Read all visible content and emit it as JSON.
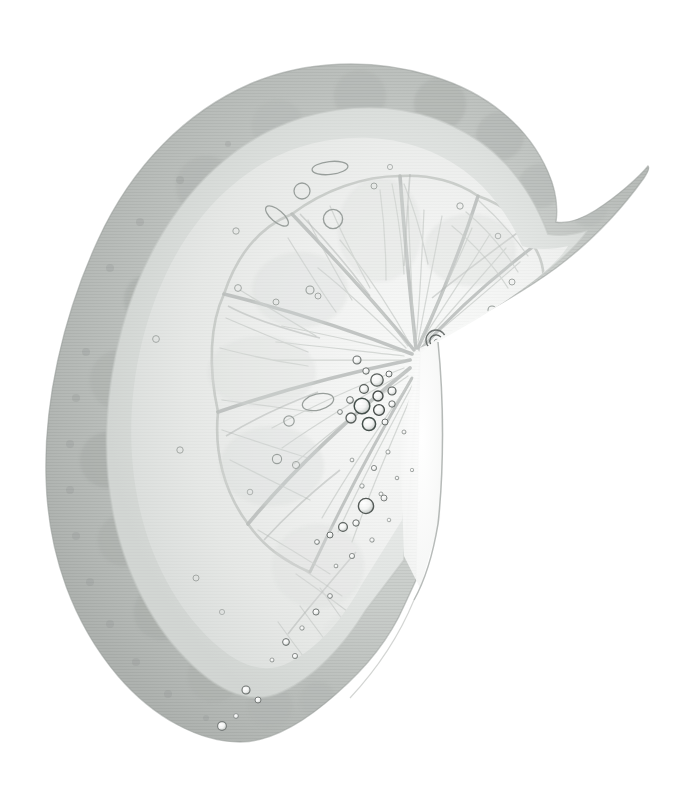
{
  "image": {
    "subject": "citrus-fruit-half-slice",
    "common_name": "Lemon slice",
    "orientation": "cut face toward viewer, rind arcing from lower-left around the top to the upper-right",
    "rendering": "desaturated grayscale photographic scan on plain white background",
    "background_color": "#ffffff",
    "canvas": {
      "width": 692,
      "height": 804
    }
  },
  "palette": {
    "background": "#ffffff",
    "rind_outer": "#b6bab7",
    "rind_mid": "#c0c4c1",
    "rind_inner": "#cbcfcc",
    "pith_band": "#dcdfdd",
    "flesh_light": "#f2f3f2",
    "flesh_mid": "#e6e8e6",
    "flesh_shadow": "#d4d7d5",
    "segment_membrane": "#b9bdbb",
    "vesicle_line": "#c7cbc8",
    "core_white": "#fbfbfb",
    "bubble_outline": "#6e7371",
    "bubble_dark": "#4a4f4d",
    "bubble_fill": "#f6f7f6",
    "cut_edge_line": "#9fa4a1"
  },
  "geometry": {
    "peel_outer_left_x": 40,
    "peel_top_y": 62,
    "peel_right_tip_x": 648,
    "bottom_tip_y": 742,
    "core_center_x": 420,
    "core_center_y": 352,
    "cut_edge_top_y": 346,
    "cut_edge_bottom_y": 600
  },
  "parts": [
    {
      "id": "rind",
      "label": "Rind / exocarp",
      "note": "mid-gray mottled band forming the outer arc"
    },
    {
      "id": "pith",
      "label": "Pith / albedo",
      "note": "paler inner band between rind and flesh"
    },
    {
      "id": "flesh",
      "label": "Flesh / endocarp",
      "note": "pale segmented pulp with radiating juice vesicles"
    },
    {
      "id": "membranes",
      "label": "Segment membranes",
      "note": "darker curved dividing walls between segments"
    },
    {
      "id": "core",
      "label": "Central core / columella",
      "note": "bright wedge at the cut center where segments converge"
    },
    {
      "id": "bubbles",
      "label": "Air bubbles",
      "note": "ring-outlined droplets clustered along the cut face near the core"
    }
  ],
  "segments": [
    {
      "index": 1,
      "label": "segment-upper-right",
      "angle_deg": -62
    },
    {
      "index": 2,
      "label": "segment-upper-right-inner",
      "angle_deg": -34
    },
    {
      "index": 3,
      "label": "segment-top",
      "angle_deg": -8
    },
    {
      "index": 4,
      "label": "segment-upper-left",
      "angle_deg": 22
    },
    {
      "index": 5,
      "label": "segment-left",
      "angle_deg": 58
    },
    {
      "index": 6,
      "label": "segment-lower-left",
      "angle_deg": 96
    },
    {
      "index": 7,
      "label": "segment-bottom",
      "angle_deg": 132
    }
  ],
  "bubble_clusters": [
    {
      "name": "core-upper-cluster",
      "count": 14,
      "x": 372,
      "y": 392,
      "spread": 40,
      "size_range": [
        3,
        11
      ]
    },
    {
      "name": "core-ring-bubble",
      "count": 1,
      "x": 436,
      "y": 340,
      "spread": 6,
      "size_range": [
        9,
        11
      ]
    },
    {
      "name": "mid-cut-face-scatter",
      "count": 9,
      "x": 375,
      "y": 470,
      "spread": 48,
      "size_range": [
        2,
        6
      ]
    },
    {
      "name": "lower-cut-cluster",
      "count": 10,
      "x": 350,
      "y": 520,
      "spread": 40,
      "size_range": [
        3,
        9
      ]
    },
    {
      "name": "bottom-trail",
      "count": 8,
      "x": 300,
      "y": 640,
      "spread": 56,
      "size_range": [
        3,
        8
      ]
    },
    {
      "name": "upper-left-scatter",
      "count": 10,
      "x": 280,
      "y": 250,
      "spread": 90,
      "size_range": [
        3,
        13
      ]
    },
    {
      "name": "left-flesh-scatter",
      "count": 8,
      "x": 220,
      "y": 420,
      "spread": 90,
      "size_range": [
        2,
        8
      ]
    }
  ]
}
